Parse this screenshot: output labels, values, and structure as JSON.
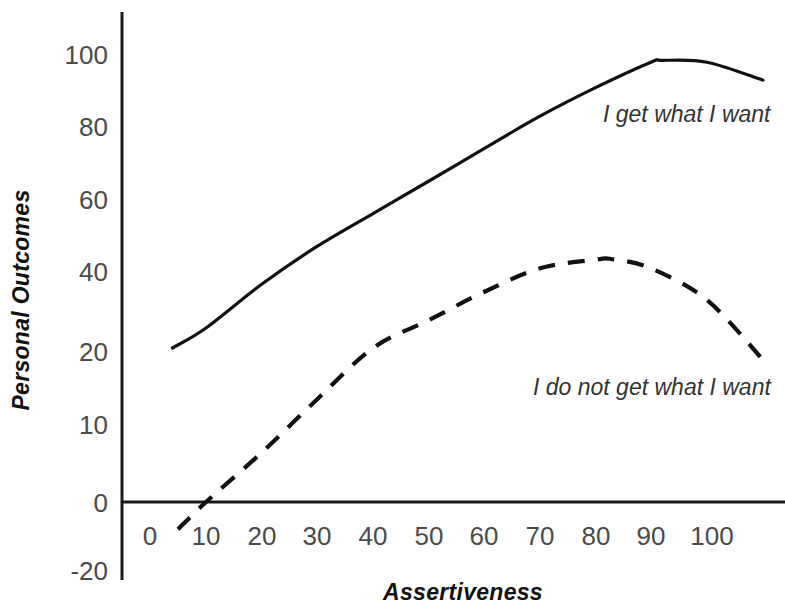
{
  "chart_data": {
    "type": "line",
    "title": "",
    "xlabel": "Assertiveness",
    "ylabel": "Personal Outcomes",
    "xlim": [
      0,
      110
    ],
    "ylim": [
      -20,
      105
    ],
    "grid": false,
    "legend_position": "inline-annotation",
    "x_ticks": [
      "0",
      "10",
      "20",
      "30",
      "40",
      "50",
      "60",
      "70",
      "80",
      "90",
      "100"
    ],
    "x_tick_values": [
      0,
      10,
      20,
      30,
      40,
      50,
      60,
      70,
      80,
      90,
      100
    ],
    "y_ticks": [
      "100",
      "80",
      "60",
      "40",
      "20",
      "10",
      "0",
      "-20"
    ],
    "y_tick_values": [
      100,
      80,
      60,
      40,
      20,
      10,
      0,
      -20
    ],
    "y_axis_note": "non-uniform spacing between 0, 10 and 20",
    "series": [
      {
        "name": "I get what I want",
        "style": "solid",
        "color": "#111111",
        "x": [
          4,
          10,
          20,
          30,
          40,
          50,
          60,
          70,
          80,
          90,
          92,
          100,
          110
        ],
        "values": [
          21,
          26,
          37,
          47,
          56,
          65,
          74,
          83,
          91,
          98,
          98.5,
          98,
          93
        ]
      },
      {
        "name": "I do not get what I want",
        "style": "dashed",
        "color": "#111111",
        "x": [
          5,
          10,
          20,
          30,
          40,
          50,
          60,
          70,
          80,
          83,
          90,
          100,
          110
        ],
        "values": [
          -7,
          0,
          7,
          14,
          21,
          28,
          35,
          41,
          43.4,
          43.5,
          41,
          33,
          19
        ]
      }
    ]
  },
  "axis": {
    "y_title": "Personal Outcomes",
    "x_title": "Assertiveness"
  },
  "annotations": {
    "solid_label": "I get what I want",
    "dashed_label": "I do not get what I want"
  },
  "colors": {
    "line": "#111111",
    "tick_text": "#4a4a4a",
    "axis_title": "#111111",
    "background": "#ffffff"
  }
}
